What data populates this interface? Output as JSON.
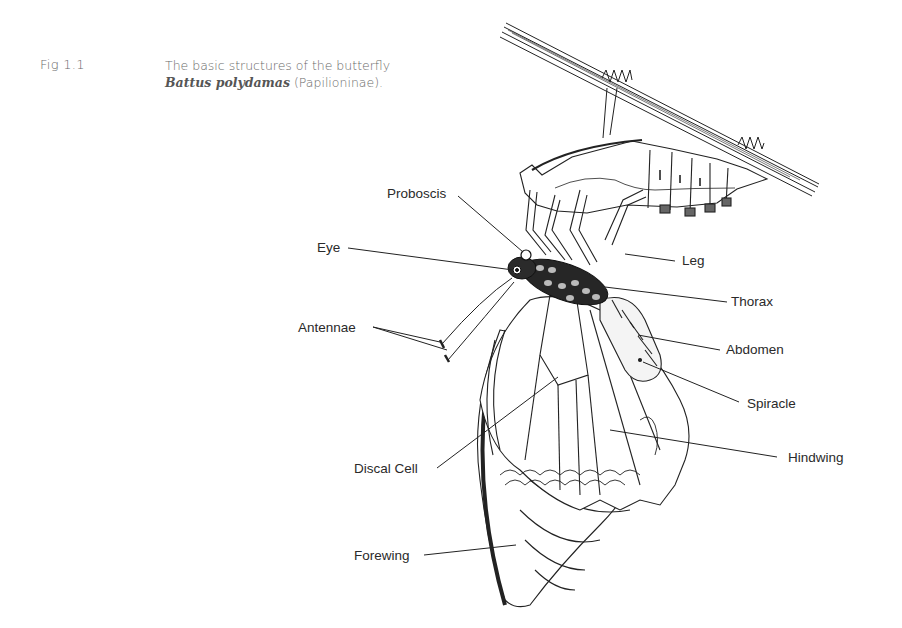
{
  "caption": {
    "figure_number": "Fig 1.1",
    "line1": "The basic structures of the butterfly",
    "species": "Battus polydamas",
    "subfamily": "(Papilioninae)."
  },
  "labels": {
    "proboscis": "Proboscis",
    "eye": "Eye",
    "antennae": "Antennae",
    "leg": "Leg",
    "thorax": "Thorax",
    "abdomen": "Abdomen",
    "spiracle": "Spiracle",
    "discal_cell": "Discal Cell",
    "hindwing": "Hindwing",
    "forewing": "Forewing"
  },
  "colors": {
    "ink": "#1a1a1a",
    "caption": "#6a6a6a",
    "background": "#ffffff"
  }
}
